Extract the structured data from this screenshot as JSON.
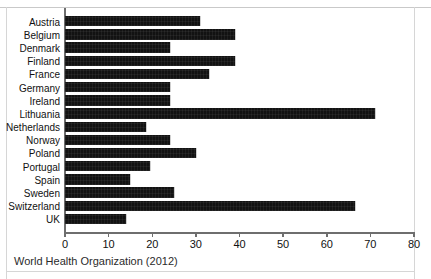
{
  "figure": {
    "caption": "World Health Organization (2012)",
    "top_cropped_text": "",
    "bar_color": "#121212",
    "axis_color": "#6e6e6e"
  },
  "chart_data": {
    "type": "bar",
    "orientation": "horizontal",
    "title": "",
    "subtitle": "",
    "xlabel": "",
    "ylabel": "",
    "xlim": [
      0,
      80
    ],
    "xticks": [
      0,
      10,
      20,
      30,
      40,
      50,
      60,
      70,
      80
    ],
    "xtick_labels": [
      "0",
      "10",
      "20",
      "30",
      "40",
      "50",
      "60",
      "70",
      "80"
    ],
    "grid": false,
    "legend": false,
    "source_note": "World Health Organization (2012)",
    "categories": [
      "Austria",
      "Belgium",
      "Denmark",
      "Finland",
      "France",
      "Germany",
      "Ireland",
      "Lithuania",
      "Netherlands",
      "Norway",
      "Poland",
      "Portugal",
      "Spain",
      "Sweden",
      "Switzerland",
      "UK"
    ],
    "values": [
      31,
      39,
      24,
      39,
      33,
      24,
      24,
      71,
      18.5,
      24,
      30,
      19.5,
      15,
      25,
      66.5,
      14
    ]
  }
}
